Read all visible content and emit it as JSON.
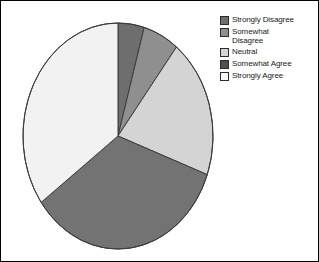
{
  "chart_data": {
    "type": "pie",
    "title": "",
    "subtitle": "",
    "xlabel": "",
    "ylabel": "",
    "grid": false,
    "legend_position": "right",
    "start_angle_deg": 0,
    "direction": "clockwise",
    "shape": "ellipse",
    "categories": [
      "Strongly Disagree",
      "Somewhat Disagree",
      "Neutral",
      "Somewhat Agree",
      "Strongly Agree"
    ],
    "values": [
      4.5,
      6.0,
      20.0,
      34.5,
      35.0
    ],
    "units": "percent",
    "slices": [
      {
        "label": "Strongly Disagree",
        "value": 4.5,
        "start_deg": 0,
        "end_deg": 16,
        "color": "#6e6e6e"
      },
      {
        "label": "Somewhat Disagree",
        "value": 6.0,
        "start_deg": 16,
        "end_deg": 38,
        "color": "#8f8f8f"
      },
      {
        "label": "Neutral",
        "value": 20.0,
        "start_deg": 38,
        "end_deg": 110,
        "color": "#d4d4d4"
      },
      {
        "label": "Somewhat Agree",
        "value": 34.5,
        "start_deg": 110,
        "end_deg": 234,
        "color": "#737373"
      },
      {
        "label": "Strongly Agree",
        "value": 35.0,
        "start_deg": 234,
        "end_deg": 360,
        "color": "#f2f2f2"
      }
    ],
    "geometry": {
      "center_x": 117,
      "center_y": 135,
      "radius_x": 95,
      "radius_y": 113,
      "outline_color": "#3c3c3c"
    }
  },
  "legend": {
    "items": [
      {
        "label": "Strongly Disagree",
        "color": "#6e6e6e"
      },
      {
        "label": "Somewhat\nDisagree",
        "color": "#8f8f8f"
      },
      {
        "label": "Neutral",
        "color": "#d4d4d4"
      },
      {
        "label": "Somewhat Agree",
        "color": "#4f4f4f"
      },
      {
        "label": "Strongly Agree",
        "color": "#fbfbfb"
      }
    ]
  },
  "figure": {
    "border_color": "#000000",
    "background": "#ffffff"
  }
}
